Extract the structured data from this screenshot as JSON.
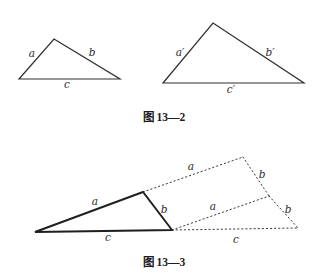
{
  "figure_13_2": {
    "caption": "图 13—2",
    "small_triangle": {
      "a": "a",
      "b": "b",
      "c": "c"
    },
    "large_triangle": {
      "a": "a′",
      "b": "b′",
      "c": "c′"
    }
  },
  "figure_13_3": {
    "caption": "图 13—3",
    "solid_triangle": {
      "a": "a",
      "b": "b",
      "c": "c"
    },
    "dotted_construction": {
      "a_top": "a",
      "b_top": "b",
      "a_middle": "a",
      "b_right": "b",
      "c_extension": "c"
    }
  },
  "colors": {
    "background": "#ffffff",
    "ink": "#2b2b2b"
  }
}
